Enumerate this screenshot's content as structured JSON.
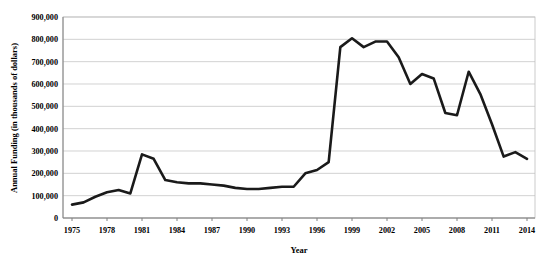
{
  "chart_data": {
    "type": "line",
    "title": "",
    "xlabel": "Year",
    "ylabel": "Annual Funding (in thousands of dollars)",
    "xlim": [
      1975,
      2014
    ],
    "ylim": [
      0,
      900000
    ],
    "grid": true,
    "legend": "none",
    "y_tick_labels": [
      "900,000",
      "800,000",
      "700,000",
      "600,000",
      "500,000",
      "400,000",
      "300,000",
      "200,000",
      "100,000",
      "0"
    ],
    "y_tick_values": [
      900000,
      800000,
      700000,
      600000,
      500000,
      400000,
      300000,
      200000,
      100000,
      0
    ],
    "x_tick_labels": [
      "1975",
      "1978",
      "1981",
      "1984",
      "1987",
      "1990",
      "1993",
      "1996",
      "1999",
      "2002",
      "2005",
      "2008",
      "2011",
      "2014"
    ],
    "x_tick_values": [
      1975,
      1978,
      1981,
      1984,
      1987,
      1990,
      1993,
      1996,
      1999,
      2002,
      2005,
      2008,
      2011,
      2014
    ],
    "x": [
      1975,
      1976,
      1977,
      1978,
      1979,
      1980,
      1981,
      1982,
      1983,
      1984,
      1985,
      1986,
      1987,
      1988,
      1989,
      1990,
      1991,
      1992,
      1993,
      1994,
      1995,
      1996,
      1997,
      1998,
      1999,
      2000,
      2001,
      2002,
      2003,
      2004,
      2005,
      2006,
      2007,
      2008,
      2009,
      2010,
      2011,
      2012,
      2013,
      2014
    ],
    "series": [
      {
        "name": "Annual Funding",
        "color": "#1a1a1a",
        "values": [
          60000,
          70000,
          95000,
          115000,
          125000,
          110000,
          285000,
          265000,
          170000,
          160000,
          155000,
          155000,
          150000,
          145000,
          135000,
          130000,
          130000,
          135000,
          140000,
          140000,
          200000,
          215000,
          250000,
          765000,
          805000,
          765000,
          790000,
          790000,
          720000,
          600000,
          645000,
          625000,
          470000,
          460000,
          655000,
          555000,
          420000,
          275000,
          295000,
          265000
        ]
      }
    ]
  },
  "geometry": {
    "plot_left": 63,
    "plot_right": 535,
    "plot_top": 17,
    "plot_bottom": 218
  }
}
